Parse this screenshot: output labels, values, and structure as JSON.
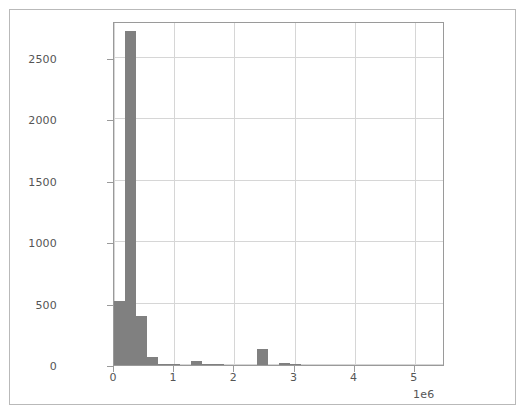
{
  "chart_data": {
    "type": "bar",
    "subtype": "histogram",
    "title": "",
    "subtitle": "",
    "xlabel": "",
    "ylabel": "",
    "xlim": [
      0,
      5500000
    ],
    "ylim": [
      0,
      2800
    ],
    "grid": true,
    "legend": null,
    "x_exponent_label": "1e6",
    "x_tick_values": [
      0,
      1000000,
      2000000,
      3000000,
      4000000,
      5000000
    ],
    "x_tick_labels": [
      "0",
      "1",
      "2",
      "3",
      "4",
      "5"
    ],
    "y_tick_values": [
      0,
      500,
      1000,
      1500,
      2000,
      2500
    ],
    "y_tick_labels": [
      "0",
      "500",
      "1000",
      "1500",
      "2000",
      "2500"
    ],
    "bin_width": 183000,
    "bin_edges": [
      0,
      183000,
      366000,
      549000,
      732000,
      915000,
      1098000,
      1281000,
      1464000,
      1647000,
      1830000,
      2013000,
      2196000,
      2379000,
      2562000,
      2745000,
      2928000,
      3111000
    ],
    "bin_centers": [
      91500,
      274500,
      457500,
      640500,
      823500,
      1006500,
      1189500,
      1372500,
      1555500,
      1738500,
      1921500,
      2104500,
      2287500,
      2470500,
      2653500,
      2836500,
      3019500
    ],
    "values": [
      520,
      2720,
      400,
      65,
      12,
      3,
      0,
      35,
      2,
      6,
      0,
      0,
      0,
      130,
      0,
      20,
      2
    ],
    "categories": [
      "0.00e6",
      "0.18e6",
      "0.37e6",
      "0.55e6",
      "0.73e6",
      "0.92e6",
      "1.10e6",
      "1.28e6",
      "1.46e6",
      "1.65e6",
      "1.83e6",
      "2.01e6",
      "2.20e6",
      "2.38e6",
      "2.56e6",
      "2.75e6",
      "2.93e6"
    ],
    "bar_color": "#808080",
    "grid_color": "#d6d6d6",
    "axis_color": "#9a9a9a",
    "tick_label_color": "#555555",
    "background_color": "#ffffff"
  },
  "figure": {
    "border_color": "#b9b9b9",
    "background_color": "#ffffff"
  }
}
